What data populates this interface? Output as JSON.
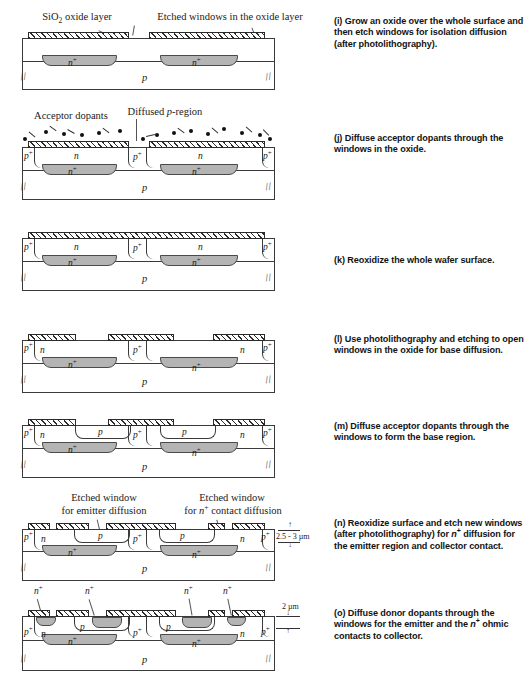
{
  "figure": {
    "type": "process-flow-diagram",
    "width": 530,
    "height": 692
  },
  "steps": [
    {
      "key": "i",
      "marker": "(i)",
      "caption_lines": [
        "Grow an oxide over the whole surface and",
        "then etch windows for isolation diffusion (after",
        "photolithography)."
      ],
      "annotations": [
        {
          "name": "sio2-oxide-layer",
          "text": "SiO2 oxide layer"
        },
        {
          "name": "etched-windows-oxide",
          "text": "Etched windows in the oxide layer"
        }
      ],
      "region_labels": [
        "n+",
        "n+",
        "p"
      ]
    },
    {
      "key": "j",
      "marker": "(j)",
      "caption_lines": [
        "Diffuse acceptor dopants through the",
        "windows in the oxide."
      ],
      "annotations": [
        {
          "name": "acceptor-dopants",
          "text": "Acceptor dopants"
        },
        {
          "name": "diffused-p-region",
          "text": "Diffused p-region"
        }
      ],
      "region_labels": [
        "p+",
        "n",
        "n+",
        "p+",
        "n",
        "n+",
        "p+",
        "p"
      ]
    },
    {
      "key": "k",
      "marker": "(k)",
      "caption_lines": [
        "Reoxidize the whole wafer surface."
      ],
      "annotations": [],
      "region_labels": [
        "p+",
        "n",
        "n+",
        "p+",
        "n",
        "n+",
        "p+",
        "p"
      ]
    },
    {
      "key": "l",
      "marker": "(l)",
      "caption_lines": [
        "Use photolithography and etching to open",
        "windows in the oxide for base diffusion."
      ],
      "annotations": [],
      "region_labels": [
        "p+",
        "n",
        "n+",
        "p+",
        "n",
        "n+",
        "p+",
        "p"
      ]
    },
    {
      "key": "m",
      "marker": "(m)",
      "caption_lines": [
        "Diffuse acceptor dopants through",
        "the windows to form the base region."
      ],
      "annotations": [],
      "region_labels": [
        "p+",
        "n",
        "p",
        "n+",
        "p+",
        "p",
        "n+",
        "n",
        "p+",
        "p"
      ]
    },
    {
      "key": "n",
      "marker": "(n)",
      "caption_lines": [
        "Reoxidize surface and etch new windows",
        "(after photolithography) for n+ diffusion for",
        "the emitter region and collector contact."
      ],
      "annotations": [
        {
          "name": "etched-window-emitter",
          "text_line1": "Etched window",
          "text_line2": "for emitter diffusion"
        },
        {
          "name": "etched-window-contact",
          "text_line1": "Etched window",
          "text_line2": "for n+ contact diffusion"
        }
      ],
      "dimension": "2.5 - 3 µm",
      "region_labels": [
        "p+",
        "n",
        "p",
        "n+",
        "p+",
        "p",
        "n+",
        "n",
        "p+",
        "p"
      ]
    },
    {
      "key": "o",
      "marker": "(o)",
      "caption_lines": [
        "Diffuse donor dopants through",
        "the windows for the emitter and",
        "the n+ ohmic contacts to collector."
      ],
      "annotations": [],
      "dimension": "2 µm",
      "top_labels": [
        "n+",
        "n+",
        "n+",
        "n+"
      ],
      "region_labels": [
        "p+",
        "n",
        "p",
        "n+",
        "p+",
        "p",
        "n+",
        "n",
        "p+",
        "p"
      ]
    }
  ],
  "legend": {
    "n_plus": "n+",
    "p_plus": "p+",
    "n": "n",
    "p": "p"
  },
  "colors": {
    "buried_layer_fill": "#b4b4b4",
    "oxide_hatch": "#2a2a2a",
    "outline": "#3a3a3a",
    "background": "#ffffff",
    "caption_text": "#121212"
  }
}
